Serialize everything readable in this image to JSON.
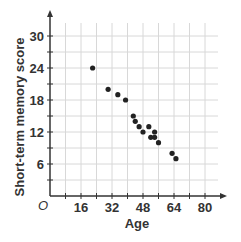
{
  "chart_data": {
    "type": "scatter",
    "title": "",
    "xlabel": "Age",
    "ylabel": "Short-term memory score",
    "origin_label": "O",
    "xlim": [
      0,
      88
    ],
    "ylim": [
      0,
      33
    ],
    "x_ticks": [
      16,
      32,
      48,
      64,
      80
    ],
    "y_ticks": [
      6,
      12,
      18,
      24,
      30
    ],
    "x_grid_step": 8,
    "y_grid_step": 3,
    "grid": true,
    "legend": null,
    "points": [
      {
        "x": 22,
        "y": 24
      },
      {
        "x": 30,
        "y": 20
      },
      {
        "x": 35,
        "y": 19
      },
      {
        "x": 39,
        "y": 18
      },
      {
        "x": 43,
        "y": 15
      },
      {
        "x": 44,
        "y": 14
      },
      {
        "x": 46,
        "y": 13
      },
      {
        "x": 48,
        "y": 12
      },
      {
        "x": 51,
        "y": 13
      },
      {
        "x": 52,
        "y": 11
      },
      {
        "x": 54,
        "y": 12
      },
      {
        "x": 54,
        "y": 11
      },
      {
        "x": 56,
        "y": 10
      },
      {
        "x": 63,
        "y": 8
      },
      {
        "x": 65,
        "y": 7
      }
    ]
  },
  "colors": {
    "axis": "#333333",
    "grid": "#d8d8d8",
    "point": "#222222",
    "text": "#333333"
  }
}
